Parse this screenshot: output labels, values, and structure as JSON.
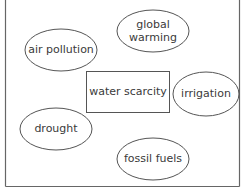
{
  "diagram": {
    "type": "concept-map",
    "colors": {
      "background": "#ffffff",
      "stroke": "#555555",
      "frame": "#666666",
      "text": "#3a3a3a"
    },
    "center": {
      "label": "water scarcity",
      "shape": "rectangle",
      "x": 86,
      "y": 71,
      "w": 83,
      "h": 41
    },
    "nodes": [
      {
        "id": "air-pollution",
        "lines": [
          "air pollution"
        ],
        "cx": 61,
        "cy": 50,
        "rx": 36,
        "ry": 21
      },
      {
        "id": "global-warming",
        "lines": [
          "global",
          "warming"
        ],
        "cx": 153,
        "cy": 31,
        "rx": 36,
        "ry": 21
      },
      {
        "id": "irrigation",
        "lines": [
          "irrigation"
        ],
        "cx": 206,
        "cy": 94,
        "rx": 33,
        "ry": 22
      },
      {
        "id": "drought",
        "lines": [
          "drought"
        ],
        "cx": 56,
        "cy": 129,
        "rx": 36,
        "ry": 21
      },
      {
        "id": "fossil-fuels",
        "lines": [
          "fossil fuels"
        ],
        "cx": 153,
        "cy": 159,
        "rx": 36,
        "ry": 21
      }
    ]
  }
}
